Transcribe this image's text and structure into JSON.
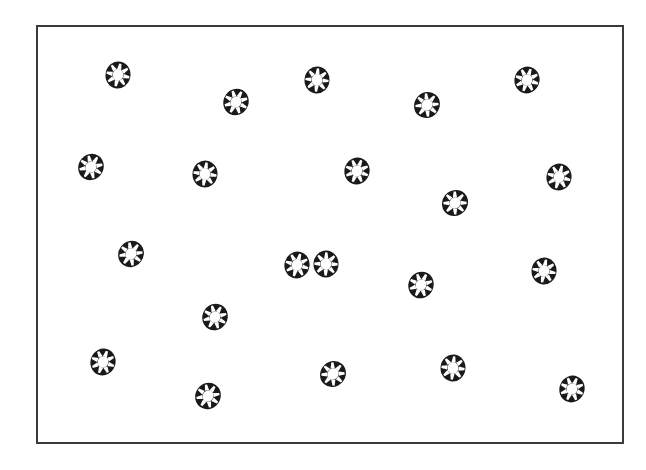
{
  "figure": {
    "title": "",
    "caption": "",
    "background_color": "#ffffff"
  },
  "frame": {
    "name": "plot-frame",
    "x": 36,
    "y": 25,
    "width": 588,
    "height": 419,
    "border_width": 2,
    "border_color": "#3b3b3b",
    "fill_color": "#ffffff"
  },
  "marker": {
    "name": "cog-icon",
    "shape": "cog",
    "fill_color": "#1a1a1a",
    "hub_color": "#ffffff",
    "spoke_color": "#ffffff",
    "spoke_count": 8,
    "outer_width": 25,
    "outer_height": 27,
    "hub_diameter_ratio": 0.44
  },
  "chart_data": {
    "type": "scatter",
    "title": "",
    "xlabel": "",
    "ylabel": "",
    "grid": false,
    "legend": null,
    "xlim": [
      36,
      624
    ],
    "ylim": [
      25,
      444
    ],
    "count": 21,
    "series": [
      {
        "name": "cog-markers",
        "marker": "cog",
        "color": "#1a1a1a",
        "points": [
          {
            "id": 1,
            "x": 118,
            "y": 75,
            "rot": 12
          },
          {
            "id": 2,
            "x": 236,
            "y": 102,
            "rot": 28
          },
          {
            "id": 3,
            "x": 317,
            "y": 80,
            "rot": 5
          },
          {
            "id": 4,
            "x": 427,
            "y": 105,
            "rot": 40
          },
          {
            "id": 5,
            "x": 527,
            "y": 80,
            "rot": 18
          },
          {
            "id": 6,
            "x": 91,
            "y": 167,
            "rot": 33
          },
          {
            "id": 7,
            "x": 205,
            "y": 174,
            "rot": 8
          },
          {
            "id": 8,
            "x": 357,
            "y": 171,
            "rot": 22
          },
          {
            "id": 9,
            "x": 455,
            "y": 203,
            "rot": 44
          },
          {
            "id": 10,
            "x": 559,
            "y": 177,
            "rot": 15
          },
          {
            "id": 11,
            "x": 131,
            "y": 254,
            "rot": 37
          },
          {
            "id": 12,
            "x": 326,
            "y": 264,
            "rot": 2
          },
          {
            "id": 13,
            "x": 421,
            "y": 285,
            "rot": 26
          },
          {
            "id": 14,
            "x": 544,
            "y": 271,
            "rot": 10
          },
          {
            "id": 15,
            "x": 215,
            "y": 317,
            "rot": 30
          },
          {
            "id": 16,
            "x": 103,
            "y": 362,
            "rot": 20
          },
          {
            "id": 17,
            "x": 333,
            "y": 374,
            "rot": 42
          },
          {
            "id": 18,
            "x": 453,
            "y": 368,
            "rot": 6
          },
          {
            "id": 19,
            "x": 572,
            "y": 389,
            "rot": 24
          },
          {
            "id": 20,
            "x": 208,
            "y": 396,
            "rot": 35
          },
          {
            "id": 21,
            "x": 297,
            "y": 265,
            "rot": 16
          }
        ]
      }
    ]
  }
}
